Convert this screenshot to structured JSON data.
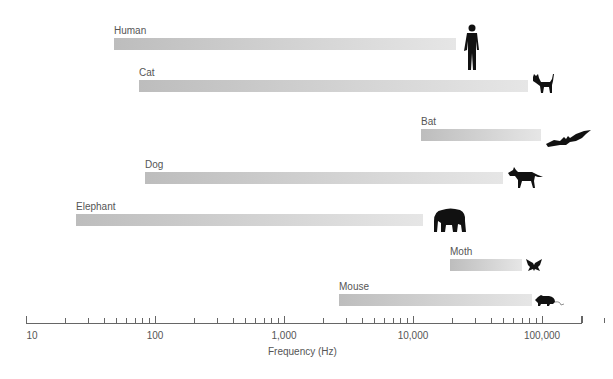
{
  "chart_data": {
    "type": "bar",
    "orientation": "horizontal-range",
    "title": "",
    "xlabel": "Frequency (Hz)",
    "ylabel": "",
    "xscale": "log",
    "xlim": [
      10,
      200000
    ],
    "tick_labels": [
      "10",
      "100",
      "1,000",
      "10,000",
      "100,000"
    ],
    "grid": false,
    "legend": null,
    "categories": [
      "Human",
      "Cat",
      "Bat",
      "Dog",
      "Elephant",
      "Moth",
      "Mouse"
    ],
    "series": [
      {
        "name": "Hearing range low (Hz)",
        "values": [
          20,
          75,
          12000,
          85,
          25,
          20000,
          2500
        ]
      },
      {
        "name": "Hearing range high (Hz)",
        "values": [
          20000,
          80000,
          100000,
          50000,
          12000,
          70000,
          85000
        ]
      }
    ],
    "icons": [
      "human-silhouette",
      "cat-silhouette",
      "bat-silhouette",
      "dog-silhouette",
      "elephant-silhouette",
      "moth-silhouette",
      "mouse-silhouette"
    ]
  },
  "labels": {
    "human": "Human",
    "cat": "Cat",
    "bat": "Bat",
    "dog": "Dog",
    "elephant": "Elephant",
    "moth": "Moth",
    "mouse": "Mouse"
  },
  "axis": {
    "t10": "10",
    "t100": "100",
    "t1000": "1,000",
    "t10000": "10,000",
    "t100000": "100,000",
    "title": "Frequency (Hz)"
  }
}
